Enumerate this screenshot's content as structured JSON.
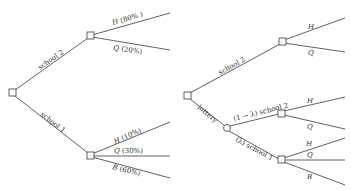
{
  "left_tree": {
    "edges": {
      "school2": "school 2",
      "school1": "school 1"
    },
    "school2_outcomes": [
      {
        "letter": "H",
        "pct": "(80% )"
      },
      {
        "letter": "Q",
        "pct": "(20%)"
      }
    ],
    "school1_outcomes": [
      {
        "letter": "H",
        "pct": "(10%)"
      },
      {
        "letter": "Q",
        "pct": "(30%)"
      },
      {
        "letter": "B",
        "pct": "(60%)"
      }
    ]
  },
  "right_tree": {
    "edges": {
      "school2": "school 2",
      "lottery": "lottery",
      "lottery_school2": "(1 − λ) school 2",
      "lottery_school1": "(λ) school 1"
    },
    "school2_outcomes": [
      {
        "letter": "H"
      },
      {
        "letter": "Q"
      }
    ],
    "lottery_school2_outcomes": [
      {
        "letter": "H"
      },
      {
        "letter": "Q"
      }
    ],
    "lottery_school1_outcomes": [
      {
        "letter": "H"
      },
      {
        "letter": "Q"
      },
      {
        "letter": "B"
      }
    ]
  }
}
